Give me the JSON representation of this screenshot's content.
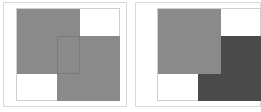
{
  "panels": [
    {
      "name": "left-panel",
      "rects": [
        {
          "name": "rect-a",
          "color": "#8a8a8a"
        },
        {
          "name": "rect-b",
          "color": "#8a8a8a"
        }
      ]
    },
    {
      "name": "right-panel",
      "rects": [
        {
          "name": "rect-a",
          "color": "#8a8a8a"
        },
        {
          "name": "rect-b",
          "color": "#4a4a4a"
        }
      ]
    }
  ],
  "colors": {
    "frame": "#cfcfcf",
    "light_gray": "#8a8a8a",
    "dark_gray": "#4a4a4a",
    "overlap_outline": "#7a7a7a"
  }
}
